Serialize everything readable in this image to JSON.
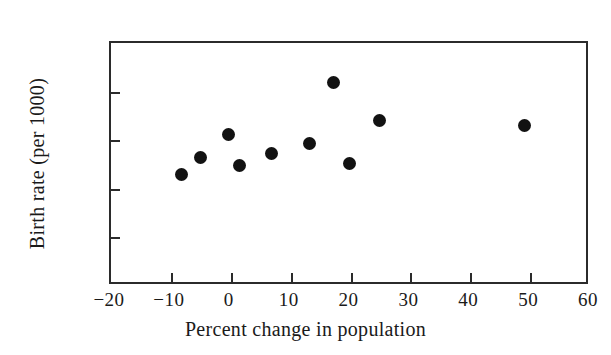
{
  "chart": {
    "title": "",
    "point_color": "#121212",
    "axis_color": "#2b2b2b",
    "background": "#ffffff"
  },
  "chart_data": {
    "type": "scatter",
    "title": "",
    "xlabel": "Percent change in population",
    "ylabel": "Birth rate (per 1000)",
    "xlim": [
      -20,
      60
    ],
    "ylim": [
      0,
      25
    ],
    "xticks": [
      -20,
      -10,
      0,
      10,
      20,
      30,
      40,
      50,
      60
    ],
    "yticks": [
      0,
      5,
      10,
      15,
      20,
      25
    ],
    "xtick_labels": [
      "−20",
      "−10",
      "0",
      "10",
      "20",
      "30",
      "40",
      "50",
      "60"
    ],
    "ytick_labels": [
      "0",
      "5",
      "10",
      "15",
      "20",
      "25"
    ],
    "grid": false,
    "legend": false,
    "series": [
      {
        "name": "States",
        "marker": "filled-circle",
        "color": "#121212",
        "points": [
          {
            "x": -8.3,
            "y": 11.5
          },
          {
            "x": -5.0,
            "y": 13.2
          },
          {
            "x": -0.3,
            "y": 15.6
          },
          {
            "x": 1.4,
            "y": 12.4
          },
          {
            "x": 6.8,
            "y": 13.6
          },
          {
            "x": 13.1,
            "y": 14.7
          },
          {
            "x": 17.1,
            "y": 20.9
          },
          {
            "x": 19.8,
            "y": 12.6
          },
          {
            "x": 24.8,
            "y": 17.0
          },
          {
            "x": 49.1,
            "y": 16.5
          }
        ]
      }
    ]
  }
}
